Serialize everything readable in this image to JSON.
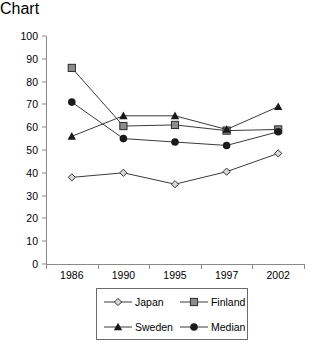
{
  "chart_data": {
    "type": "line",
    "title": "",
    "xlabel": "",
    "ylabel": "",
    "categories": [
      "1986",
      "1990",
      "1995",
      "1997",
      "2002"
    ],
    "ylim": [
      0,
      100
    ],
    "yticks": [
      0,
      10,
      20,
      30,
      40,
      50,
      60,
      70,
      80,
      90,
      100
    ],
    "grid": false,
    "legend_position": "bottom",
    "series": [
      {
        "name": "Japan",
        "marker": "open-diamond",
        "color": "#444444",
        "values": [
          38,
          40,
          35,
          40.5,
          48.5
        ]
      },
      {
        "name": "Finland",
        "marker": "gray-square",
        "color": "#808080",
        "values": [
          86,
          60.5,
          61,
          58.5,
          59
        ]
      },
      {
        "name": "Sweden",
        "marker": "black-triangle",
        "color": "#1a1a1a",
        "values": [
          56,
          65,
          65,
          59,
          69
        ]
      },
      {
        "name": "Median",
        "marker": "black-circle",
        "color": "#1a1a1a",
        "values": [
          71,
          55,
          53.5,
          52,
          58
        ]
      }
    ]
  },
  "axis": {
    "line_color": "#8a8a8a"
  },
  "legend": {
    "entries": [
      "Japan",
      "Finland",
      "Sweden",
      "Median"
    ]
  }
}
